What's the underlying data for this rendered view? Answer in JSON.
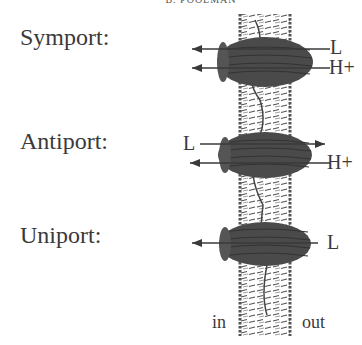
{
  "header": {
    "author": "B. POOLMAN"
  },
  "transport_types": [
    {
      "label": "Symport:",
      "ions_right": [
        "L",
        "H+"
      ],
      "arrows": [
        "left",
        "left"
      ]
    },
    {
      "label": "Antiport:",
      "ion_left": "L",
      "ion_right": "H+",
      "arrows": [
        "right",
        "left"
      ]
    },
    {
      "label": "Uniport:",
      "ion_right": "L",
      "arrows": [
        "left"
      ]
    }
  ],
  "sides": {
    "inside": "in",
    "outside": "out"
  },
  "colors": {
    "protein": "#4a4a4a",
    "membrane_outline": "#555555",
    "text": "#3a3a3a"
  }
}
